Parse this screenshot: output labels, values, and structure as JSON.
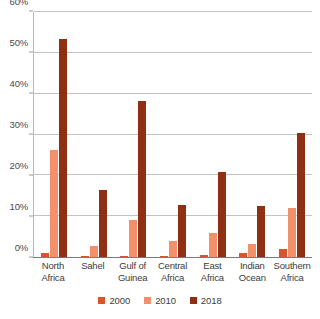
{
  "chart_data": {
    "type": "bar",
    "title": "",
    "xlabel": "",
    "ylabel": "",
    "ylim": [
      0,
      60
    ],
    "yticks": [
      "0%",
      "10%",
      "20%",
      "30%",
      "40%",
      "50%",
      "60%"
    ],
    "ytick_values": [
      0,
      10,
      20,
      30,
      40,
      50,
      60
    ],
    "grid": true,
    "legend_position": "bottom",
    "categories": [
      "North Africa",
      "Sahel",
      "Gulf of Guinea",
      "Central Africa",
      "East Africa",
      "Indian Ocean",
      "Southern Africa"
    ],
    "category_lines": [
      [
        "North",
        "Africa"
      ],
      [
        "Sahel",
        ""
      ],
      [
        "Gulf of",
        "Guinea"
      ],
      [
        "Central",
        "Africa"
      ],
      [
        "East",
        "Africa"
      ],
      [
        "Indian",
        "Ocean"
      ],
      [
        "Southern",
        "Africa"
      ]
    ],
    "series": [
      {
        "name": "2000",
        "color": "#D9542B",
        "values": [
          0.9,
          0.3,
          0.3,
          0.3,
          0.6,
          1.0,
          2.0
        ]
      },
      {
        "name": "2010",
        "color": "#F2906B",
        "values": [
          26.2,
          2.8,
          9.0,
          4.0,
          6.0,
          3.3,
          12.0
        ]
      },
      {
        "name": "2018",
        "color": "#8F3015",
        "values": [
          53.5,
          16.5,
          38.2,
          12.8,
          20.9,
          12.4,
          30.3
        ]
      }
    ]
  },
  "legend": {
    "items": [
      {
        "label": "2000",
        "color": "#D9542B"
      },
      {
        "label": "2010",
        "color": "#F2906B"
      },
      {
        "label": "2018",
        "color": "#8F3015"
      }
    ]
  },
  "colors": {
    "series_2000": "#D9542B",
    "series_2010": "#F2906B",
    "series_2018": "#8F3015",
    "gridline": "#C2C2C2",
    "axis": "#7A7A7A",
    "text": "#3C3C3C",
    "background": "#FFFFFF"
  }
}
